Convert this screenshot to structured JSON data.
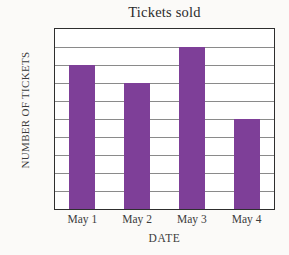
{
  "chart_data": {
    "type": "bar",
    "title": "Tickets sold",
    "xlabel": "DATE",
    "ylabel": "NUMBER OF TICKETS",
    "categories": [
      "May 1",
      "May 2",
      "May 3",
      "May 4"
    ],
    "values": [
      80,
      70,
      90,
      50
    ],
    "ylim": [
      0,
      100
    ],
    "ytick_step": 10,
    "yticks": [
      100,
      90,
      80,
      70,
      60,
      50,
      40,
      30,
      20,
      10,
      0
    ],
    "ytick_labels": [
      "100",
      "90",
      "80",
      "70",
      "60",
      "50",
      "40",
      "30",
      "20",
      "10",
      "0"
    ],
    "grid": true,
    "grid_axis": "y",
    "legend": false,
    "bar_color": "#7e3f98",
    "grid_color": "#8a8a8a",
    "frame_color": "#2e2e2e",
    "background_color": "#fbfaf8"
  }
}
